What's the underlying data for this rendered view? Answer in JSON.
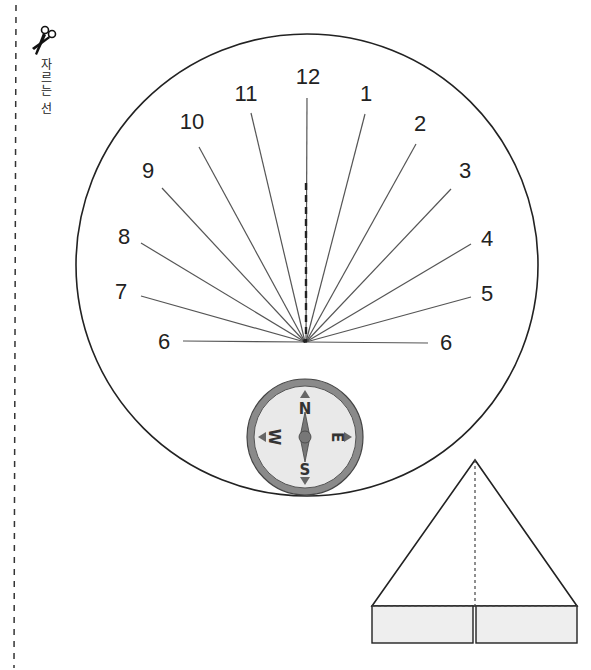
{
  "cut_line": {
    "label": "자르는 선",
    "icon": "scissors-icon"
  },
  "sundial": {
    "hours_left": [
      "6",
      "7",
      "8",
      "9",
      "10",
      "11"
    ],
    "hour_top": "12",
    "hours_right": [
      "1",
      "2",
      "3",
      "4",
      "5",
      "6"
    ],
    "labels": {
      "h12": "12",
      "h1": "1",
      "h2": "2",
      "h3": "3",
      "h4": "4",
      "h5": "5",
      "h6r": "6",
      "h11": "11",
      "h10": "10",
      "h9": "9",
      "h8": "8",
      "h7": "7",
      "h6l": "6"
    }
  },
  "compass": {
    "north": "N",
    "south": "S",
    "east": "E",
    "west": "W",
    "colors": {
      "ring": "#8a8a8a",
      "face": "#e8e8e8",
      "needle": "#666666"
    }
  },
  "gnomon": {
    "shape": "triangle-with-folding-tabs",
    "colors": {
      "tab_fill": "#eeeeee",
      "stroke": "#222222"
    }
  }
}
